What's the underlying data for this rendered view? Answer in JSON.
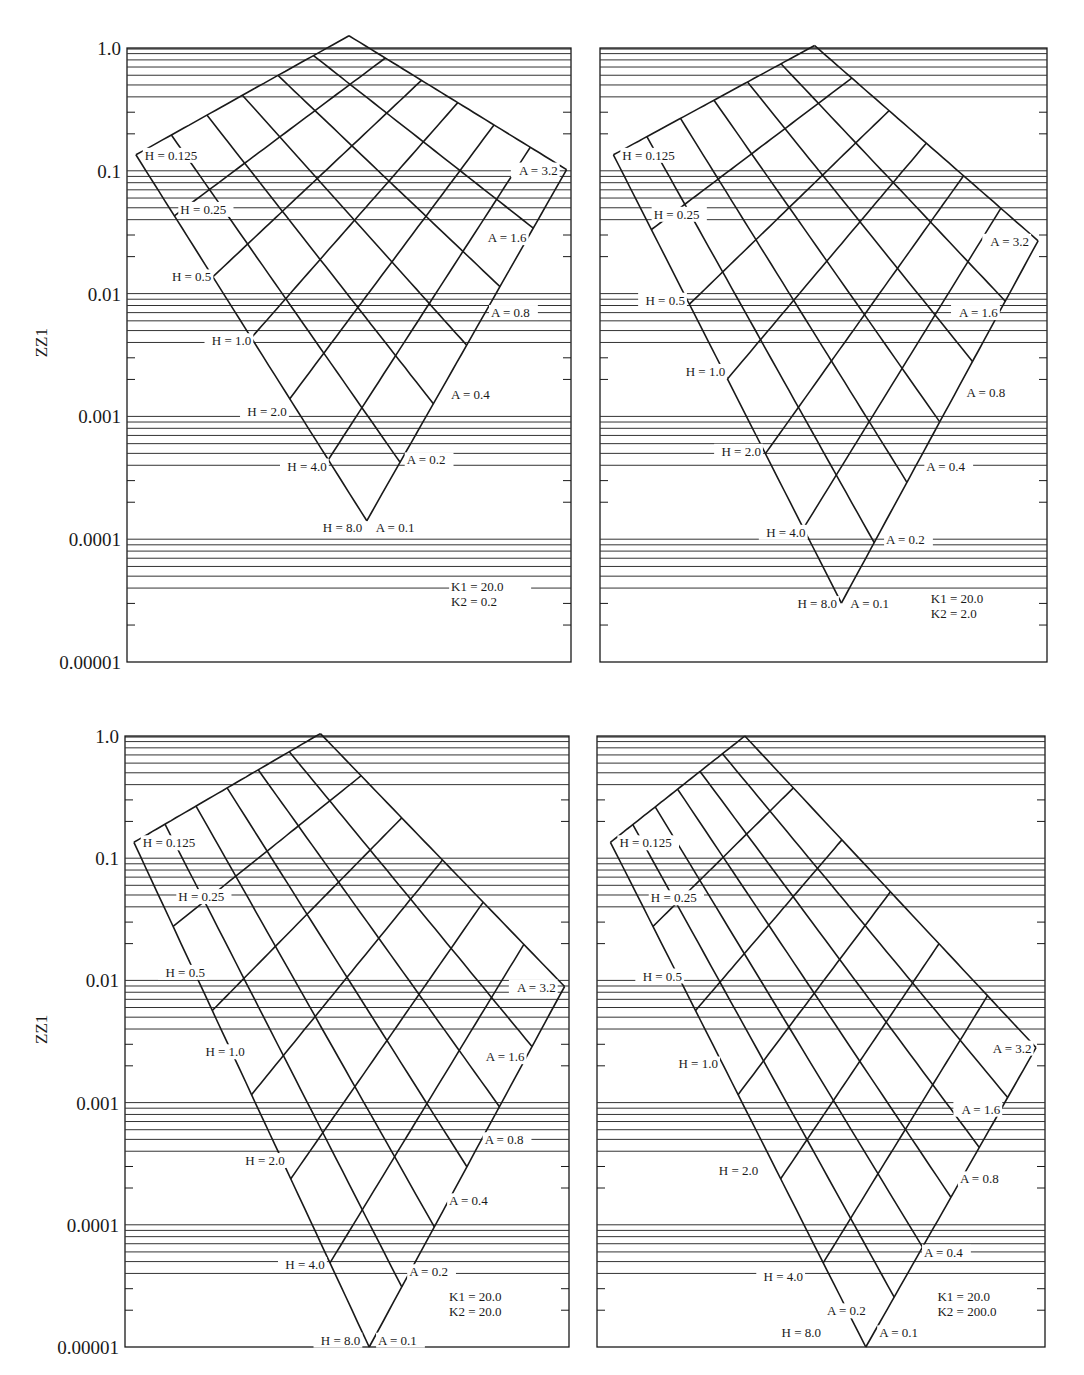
{
  "chart_data": [
    {
      "type": "line",
      "title": "",
      "panel": "top-left",
      "ylabel": "ZZ1",
      "xlabel": "",
      "yscale": "log",
      "ylim": [
        1e-05,
        1.0
      ],
      "yticks": [
        "1.0",
        "0.1",
        "0.01",
        "0.001",
        "0.0001",
        "0.00001"
      ],
      "grid": true,
      "params": {
        "K1": "K1 = 20.0",
        "K2": "K2 = 0.2"
      },
      "H_values": [
        "0.125",
        "0.25",
        "0.5",
        "1.0",
        "2.0",
        "4.0",
        "8.0"
      ],
      "A_values": [
        "0.1",
        "0.2",
        "0.4",
        "0.8",
        "1.6",
        "3.2"
      ],
      "corners": {
        "left": {
          "x": 0.02,
          "logy": -0.87
        },
        "bottom": {
          "x": 0.54,
          "logy": -3.85
        },
        "right": {
          "x": 0.99,
          "logy": -0.99
        },
        "top": {
          "x": 0.5,
          "logy": 0.1
        }
      },
      "node_labels": [
        {
          "text": "H = 0.125",
          "x": 0.04,
          "logy": -0.87,
          "anchor": "start"
        },
        {
          "text": "H = 0.25",
          "x": 0.12,
          "logy": -1.31,
          "anchor": "start"
        },
        {
          "text": "H = 0.5",
          "x": 0.19,
          "logy": -1.86,
          "anchor": "end"
        },
        {
          "text": "H = 1.0",
          "x": 0.28,
          "logy": -2.38,
          "anchor": "end"
        },
        {
          "text": "H = 2.0",
          "x": 0.36,
          "logy": -2.96,
          "anchor": "end"
        },
        {
          "text": "H = 4.0",
          "x": 0.45,
          "logy": -3.4,
          "anchor": "end"
        },
        {
          "text": "H = 8.0",
          "x": 0.53,
          "logy": -3.9,
          "anchor": "end"
        },
        {
          "text": "A = 0.1",
          "x": 0.56,
          "logy": -3.9,
          "anchor": "start"
        },
        {
          "text": "A = 0.2",
          "x": 0.63,
          "logy": -3.35,
          "anchor": "start"
        },
        {
          "text": "A = 0.4",
          "x": 0.73,
          "logy": -2.82,
          "anchor": "start"
        },
        {
          "text": "A = 0.8",
          "x": 0.82,
          "logy": -2.15,
          "anchor": "start"
        },
        {
          "text": "A = 1.6",
          "x": 0.9,
          "logy": -1.54,
          "anchor": "end"
        },
        {
          "text": "A = 3.2",
          "x": 0.97,
          "logy": -0.99,
          "anchor": "end"
        }
      ],
      "param_label_pos": {
        "x": 0.73,
        "logy": -4.42
      }
    },
    {
      "type": "line",
      "title": "",
      "panel": "top-right",
      "ylabel": "",
      "xlabel": "",
      "yscale": "log",
      "ylim": [
        1e-05,
        1.0
      ],
      "yticks": [],
      "grid": true,
      "params": {
        "K1": "K1 = 20.0",
        "K2": "K2 = 2.0"
      },
      "H_values": [
        "0.125",
        "0.25",
        "0.5",
        "1.0",
        "2.0",
        "4.0",
        "8.0"
      ],
      "A_values": [
        "0.1",
        "0.2",
        "0.4",
        "0.8",
        "1.6",
        "3.2"
      ],
      "corners": {
        "left": {
          "x": 0.03,
          "logy": -0.87
        },
        "bottom": {
          "x": 0.54,
          "logy": -4.52
        },
        "right": {
          "x": 0.98,
          "logy": -1.57
        },
        "top": {
          "x": 0.48,
          "logy": 0.02
        }
      },
      "node_labels": [
        {
          "text": "H = 0.125",
          "x": 0.05,
          "logy": -0.87,
          "anchor": "start"
        },
        {
          "text": "H = 0.25",
          "x": 0.12,
          "logy": -1.35,
          "anchor": "start"
        },
        {
          "text": "H = 0.5",
          "x": 0.19,
          "logy": -2.05,
          "anchor": "end"
        },
        {
          "text": "H = 1.0",
          "x": 0.28,
          "logy": -2.63,
          "anchor": "end"
        },
        {
          "text": "H = 2.0",
          "x": 0.36,
          "logy": -3.28,
          "anchor": "end"
        },
        {
          "text": "H = 4.0",
          "x": 0.46,
          "logy": -3.94,
          "anchor": "end"
        },
        {
          "text": "H = 8.0",
          "x": 0.53,
          "logy": -4.52,
          "anchor": "end"
        },
        {
          "text": "A = 0.1",
          "x": 0.56,
          "logy": -4.52,
          "anchor": "start"
        },
        {
          "text": "A = 0.2",
          "x": 0.64,
          "logy": -4.0,
          "anchor": "start"
        },
        {
          "text": "A = 0.4",
          "x": 0.73,
          "logy": -3.4,
          "anchor": "start"
        },
        {
          "text": "A = 0.8",
          "x": 0.82,
          "logy": -2.8,
          "anchor": "start"
        },
        {
          "text": "A = 1.6",
          "x": 0.89,
          "logy": -2.15,
          "anchor": "end"
        },
        {
          "text": "A = 3.2",
          "x": 0.96,
          "logy": -1.57,
          "anchor": "end"
        }
      ],
      "param_label_pos": {
        "x": 0.74,
        "logy": -4.52
      }
    },
    {
      "type": "line",
      "title": "",
      "panel": "bottom-left",
      "ylabel": "ZZ1",
      "xlabel": "",
      "yscale": "log",
      "ylim": [
        1e-05,
        1.0
      ],
      "yticks": [
        "1.0",
        "0.1",
        "0.01",
        "0.001",
        "0.0001",
        "0.00001"
      ],
      "grid": true,
      "params": {
        "K1": "K1 = 20.0",
        "K2": "K2 = 20.0"
      },
      "H_values": [
        "0.125",
        "0.25",
        "0.5",
        "1.0",
        "2.0",
        "4.0",
        "8.0"
      ],
      "A_values": [
        "0.1",
        "0.2",
        "0.4",
        "0.8",
        "1.6",
        "3.2"
      ],
      "corners": {
        "left": {
          "x": 0.02,
          "logy": -0.87
        },
        "bottom": {
          "x": 0.55,
          "logy": -5.0
        },
        "right": {
          "x": 0.99,
          "logy": -2.05
        },
        "top": {
          "x": 0.44,
          "logy": 0.02
        }
      },
      "node_labels": [
        {
          "text": "H = 0.125",
          "x": 0.04,
          "logy": -0.87,
          "anchor": "start"
        },
        {
          "text": "H = 0.25",
          "x": 0.12,
          "logy": -1.31,
          "anchor": "start"
        },
        {
          "text": "H = 0.5",
          "x": 0.18,
          "logy": -1.93,
          "anchor": "end"
        },
        {
          "text": "H = 1.0",
          "x": 0.27,
          "logy": -2.58,
          "anchor": "end"
        },
        {
          "text": "H = 2.0",
          "x": 0.36,
          "logy": -3.47,
          "anchor": "end"
        },
        {
          "text": "H = 4.0",
          "x": 0.45,
          "logy": -4.32,
          "anchor": "end"
        },
        {
          "text": "H = 8.0",
          "x": 0.53,
          "logy": -4.94,
          "anchor": "end"
        },
        {
          "text": "A = 0.1",
          "x": 0.57,
          "logy": -4.94,
          "anchor": "start"
        },
        {
          "text": "A = 0.2",
          "x": 0.64,
          "logy": -4.38,
          "anchor": "start"
        },
        {
          "text": "A = 0.4",
          "x": 0.73,
          "logy": -3.8,
          "anchor": "start"
        },
        {
          "text": "A = 0.8",
          "x": 0.81,
          "logy": -3.3,
          "anchor": "start"
        },
        {
          "text": "A = 1.6",
          "x": 0.9,
          "logy": -2.62,
          "anchor": "end"
        },
        {
          "text": "A = 3.2",
          "x": 0.97,
          "logy": -2.05,
          "anchor": "end"
        }
      ],
      "param_label_pos": {
        "x": 0.73,
        "logy": -4.62
      }
    },
    {
      "type": "line",
      "title": "",
      "panel": "bottom-right",
      "ylabel": "",
      "xlabel": "",
      "yscale": "log",
      "ylim": [
        1e-05,
        1.0
      ],
      "yticks": [],
      "grid": true,
      "params": {
        "K1": "K1 = 20.0",
        "K2": "K2 = 200.0"
      },
      "H_values": [
        "0.125",
        "0.25",
        "0.5",
        "1.0",
        "2.0",
        "4.0",
        "8.0"
      ],
      "A_values": [
        "0.1",
        "0.2",
        "0.4",
        "0.8",
        "1.6",
        "3.2"
      ],
      "corners": {
        "left": {
          "x": 0.03,
          "logy": -0.87
        },
        "bottom": {
          "x": 0.6,
          "logy": -5.0
        },
        "right": {
          "x": 0.98,
          "logy": -2.55
        },
        "top": {
          "x": 0.33,
          "logy": 0.0
        }
      },
      "node_labels": [
        {
          "text": "H = 0.125",
          "x": 0.05,
          "logy": -0.87,
          "anchor": "start"
        },
        {
          "text": "H = 0.25",
          "x": 0.12,
          "logy": -1.32,
          "anchor": "start"
        },
        {
          "text": "H = 0.5",
          "x": 0.19,
          "logy": -1.96,
          "anchor": "end"
        },
        {
          "text": "H = 1.0",
          "x": 0.27,
          "logy": -2.68,
          "anchor": "end"
        },
        {
          "text": "H = 2.0",
          "x": 0.36,
          "logy": -3.55,
          "anchor": "end"
        },
        {
          "text": "H = 4.0",
          "x": 0.46,
          "logy": -4.42,
          "anchor": "end"
        },
        {
          "text": "H = 8.0",
          "x": 0.5,
          "logy": -4.88,
          "anchor": "end"
        },
        {
          "text": "A = 0.1",
          "x": 0.63,
          "logy": -4.88,
          "anchor": "start"
        },
        {
          "text": "A = 0.2",
          "x": 0.6,
          "logy": -4.7,
          "anchor": "end"
        },
        {
          "text": "A = 0.4",
          "x": 0.73,
          "logy": -4.22,
          "anchor": "start"
        },
        {
          "text": "A = 0.8",
          "x": 0.81,
          "logy": -3.62,
          "anchor": "start"
        },
        {
          "text": "A = 1.6",
          "x": 0.9,
          "logy": -3.05,
          "anchor": "end"
        },
        {
          "text": "A = 3.2",
          "x": 0.97,
          "logy": -2.55,
          "anchor": "end"
        }
      ],
      "param_label_pos": {
        "x": 0.76,
        "logy": -4.62
      }
    }
  ],
  "layout": {
    "panels": [
      {
        "left": 127,
        "right": 571,
        "top": 48,
        "bottom": 662
      },
      {
        "left": 600,
        "right": 1047,
        "top": 48,
        "bottom": 662
      },
      {
        "left": 125,
        "right": 569,
        "top": 736,
        "bottom": 1347
      },
      {
        "left": 597,
        "right": 1045,
        "top": 736,
        "bottom": 1347
      }
    ],
    "line_color": "#1a1a1a",
    "grid_color": "#333333",
    "background": "#ffffff"
  }
}
